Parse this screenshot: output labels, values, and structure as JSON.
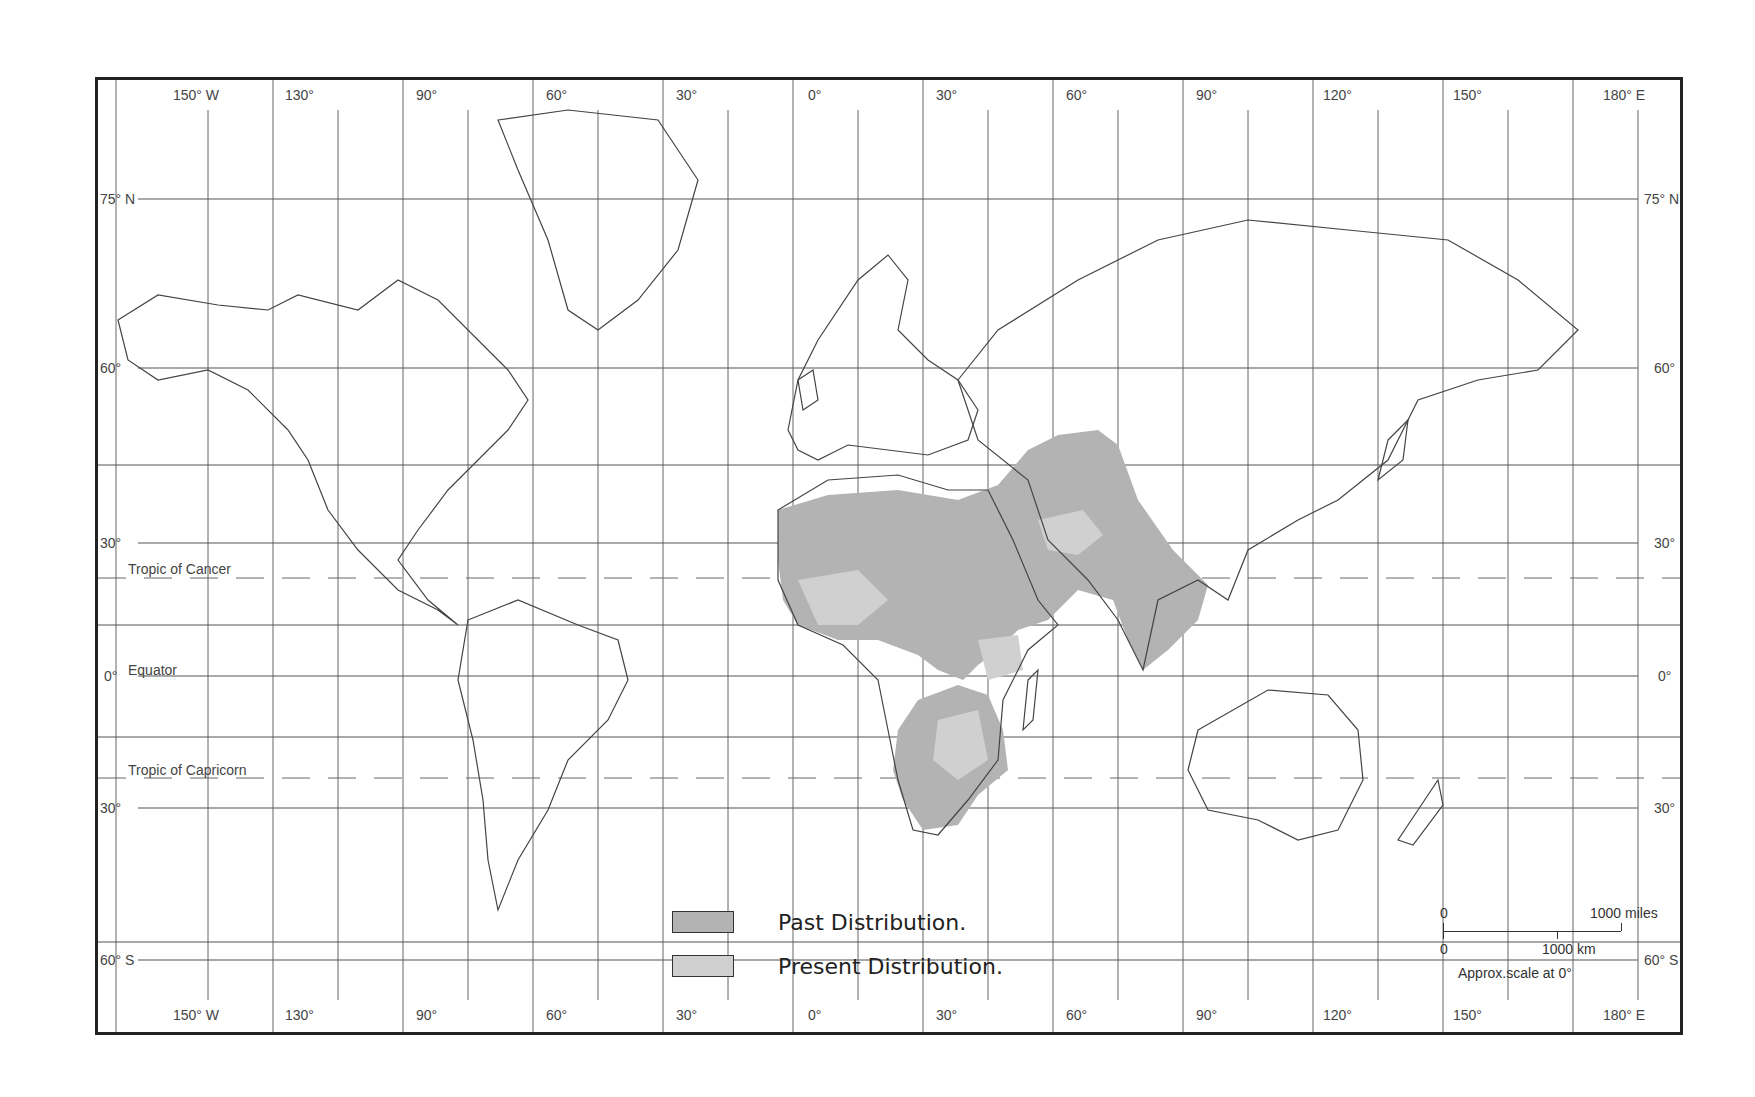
{
  "map": {
    "type": "world-distribution-map",
    "subject_region": "Africa, Middle East, South Asia",
    "colors": {
      "past_distribution": "#b3b3b3",
      "present_distribution": "#d0d0d0",
      "land_outline": "#444444",
      "grid": "#555555",
      "frame": "#222222"
    },
    "top_longitude_labels": [
      "150° W",
      "130°",
      "90°",
      "60°",
      "30°",
      "0°",
      "30°",
      "60°",
      "90°",
      "120°",
      "150°",
      "180° E"
    ],
    "bottom_longitude_labels": [
      "150° W",
      "130°",
      "90°",
      "60°",
      "30°",
      "0°",
      "30°",
      "60°",
      "90°",
      "120°",
      "150°",
      "180° E"
    ],
    "left_latitude_labels": [
      "75° N",
      "60°",
      "30°",
      "0°",
      "30°",
      "60° S"
    ],
    "right_latitude_labels": [
      "75° N",
      "60°",
      "30°",
      "0°",
      "30°",
      "60° S"
    ],
    "special_parallels": {
      "tropic_of_cancer": "Tropic of Cancer",
      "equator": "Equator",
      "tropic_of_capricorn": "Tropic of Capricorn"
    }
  },
  "legend": {
    "items": [
      {
        "label": "Past Distribution.",
        "color": "#b3b3b3"
      },
      {
        "label": "Present Distribution.",
        "color": "#d0d0d0"
      }
    ]
  },
  "scale_bar": {
    "miles_zero": "0",
    "miles_label": "1000 miles",
    "km_zero": "0",
    "km_label": "1000 km",
    "note": "Approx.scale at 0°"
  }
}
